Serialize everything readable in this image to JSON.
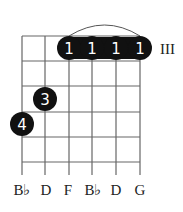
{
  "chord": {
    "position_label": "III",
    "strings": [
      "B♭",
      "D",
      "F",
      "B♭",
      "D",
      "G"
    ],
    "string_x": [
      22,
      45,
      69,
      92,
      116,
      140
    ],
    "fret_y": [
      36,
      61,
      86,
      112,
      137,
      162
    ],
    "barre": {
      "finger": "1",
      "from_string": 3,
      "to_string": 6,
      "fret": 1
    },
    "dots": [
      {
        "string": 3,
        "fret": 1,
        "finger": "1"
      },
      {
        "string": 4,
        "fret": 1,
        "finger": "1"
      },
      {
        "string": 5,
        "fret": 1,
        "finger": "1"
      },
      {
        "string": 6,
        "fret": 1,
        "finger": "1"
      },
      {
        "string": 2,
        "fret": 3,
        "finger": "3"
      },
      {
        "string": 1,
        "fret": 4,
        "finger": "4"
      }
    ]
  },
  "colors": {
    "dot": "#111111",
    "line": "#555555",
    "text": "#222222"
  }
}
